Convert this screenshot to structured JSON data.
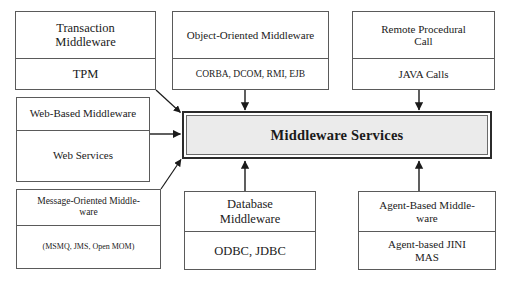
{
  "diagram": {
    "center": {
      "label": "Middleware Services",
      "fill": "#ebebeb",
      "border": "#2b2b2b"
    },
    "nodes": [
      {
        "id": "transaction",
        "top": "Transaction\nMiddleware",
        "top_line1": "Transaction",
        "top_line2": "Middleware",
        "bottom": "TPM"
      },
      {
        "id": "object-oriented",
        "top_line1": "Object-Oriented Middleware",
        "top_line2": "",
        "bottom": "CORBA, DCOM, RMI, EJB"
      },
      {
        "id": "remote-procedural-call",
        "top_line1": "Remote Procedural",
        "top_line2": "Call",
        "bottom": "JAVA Calls"
      },
      {
        "id": "web-based",
        "top_line1": "Web-Based Middleware",
        "top_line2": "",
        "bottom": "Web Services"
      },
      {
        "id": "message-oriented",
        "top_line1": "Message-Oriented Middle-",
        "top_line2": "ware",
        "bottom": "(MSMQ, JMS, Open MOM)"
      },
      {
        "id": "database",
        "top_line1": "Database",
        "top_line2": "Middleware",
        "bottom": "ODBC, JDBC"
      },
      {
        "id": "agent-based",
        "top_line1": "Agent-Based Middle-",
        "top_line2": "ware",
        "bottom_line1": "Agent-based JINI",
        "bottom_line2": "MAS"
      }
    ],
    "connectors": [
      {
        "from": "transaction",
        "to": "center",
        "style": "diagonal-arrow"
      },
      {
        "from": "object-oriented",
        "to": "center",
        "style": "vertical-arrow"
      },
      {
        "from": "remote-procedural-call",
        "to": "center",
        "style": "vertical-arrow"
      },
      {
        "from": "web-based",
        "to": "center",
        "style": "horizontal-arrow"
      },
      {
        "from": "message-oriented",
        "to": "center",
        "style": "diagonal-arrow"
      },
      {
        "from": "database",
        "to": "center",
        "style": "vertical-arrow"
      },
      {
        "from": "agent-based",
        "to": "center",
        "style": "vertical-arrow"
      }
    ]
  }
}
